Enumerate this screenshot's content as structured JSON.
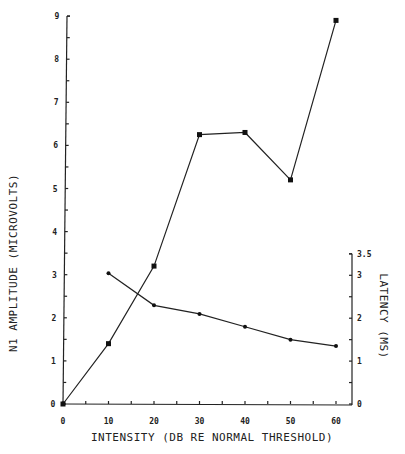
{
  "chart_data": {
    "type": "line",
    "title": "",
    "xlabel": "INTENSITY (DB RE NORMAL THRESHOLD)",
    "ylabel": "N1 AMPLITUDE (MICROVOLTS)",
    "y2label": "LATENCY (MS)",
    "x_ticks": [
      "0",
      "10",
      "20",
      "30",
      "40",
      "50",
      "60"
    ],
    "y_ticks": [
      "0",
      "1",
      "2",
      "3",
      "4",
      "5",
      "6",
      "7",
      "8",
      "9"
    ],
    "y2_ticks": [
      "0",
      "1",
      "2",
      "3",
      "3.5"
    ],
    "xlim": [
      0,
      60
    ],
    "ylim": [
      0,
      9
    ],
    "y2lim": [
      0,
      3.5
    ],
    "grid": false,
    "legend": null,
    "series": [
      {
        "name": "N1 Amplitude",
        "axis": "left",
        "marker": "square",
        "x": [
          0,
          10,
          20,
          30,
          40,
          50,
          60
        ],
        "values": [
          0,
          1.4,
          3.2,
          6.25,
          6.3,
          5.2,
          8.9
        ]
      },
      {
        "name": "Latency",
        "axis": "right",
        "marker": "diamond",
        "x": [
          10,
          20,
          30,
          40,
          50,
          60
        ],
        "values": [
          3.05,
          2.3,
          2.1,
          1.8,
          1.5,
          1.35
        ]
      }
    ]
  }
}
